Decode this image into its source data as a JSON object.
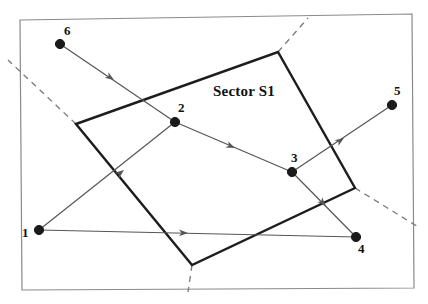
{
  "figure": {
    "width": 428,
    "height": 304,
    "background": "#ffffff",
    "frame": {
      "name": "outer-border",
      "points": "20,20 412,14 414,288 22,290",
      "color": "#8a8a8a",
      "width": 1.2
    },
    "sector": {
      "label": "Sector S1",
      "label_x": 213,
      "label_y": 83,
      "boundary_points": "76,124 278,52 355,188 192,265",
      "color": "#1d1d1d",
      "width": 2.4
    },
    "dashed": {
      "color": "#7a7a7a",
      "width": 1.3,
      "dash": "6,5",
      "segments": [
        {
          "name": "dashed-left",
          "x1": 76,
          "y1": 124,
          "x2": 8,
          "y2": 60
        },
        {
          "name": "dashed-top",
          "x1": 278,
          "y1": 52,
          "x2": 308,
          "y2": 18
        },
        {
          "name": "dashed-right",
          "x1": 355,
          "y1": 188,
          "x2": 420,
          "y2": 228
        },
        {
          "name": "dashed-bottom",
          "x1": 192,
          "y1": 265,
          "x2": 188,
          "y2": 292
        }
      ]
    },
    "edge_style": {
      "color": "#555555",
      "width": 1.2,
      "arrow_color": "#555555"
    },
    "nodes": [
      {
        "id": "1",
        "label": "1",
        "x": 39,
        "y": 230,
        "label_x": 22,
        "label_y": 226,
        "r": 4.6
      },
      {
        "id": "2",
        "label": "2",
        "x": 175,
        "y": 122,
        "label_x": 178,
        "label_y": 101,
        "r": 4.6
      },
      {
        "id": "3",
        "label": "3",
        "x": 292,
        "y": 172,
        "label_x": 291,
        "label_y": 151,
        "r": 4.6
      },
      {
        "id": "4",
        "label": "4",
        "x": 356,
        "y": 237,
        "label_x": 358,
        "label_y": 242,
        "r": 4.6
      },
      {
        "id": "5",
        "label": "5",
        "x": 392,
        "y": 105,
        "label_x": 394,
        "label_y": 84,
        "r": 4.6
      },
      {
        "id": "6",
        "label": "6",
        "x": 60,
        "y": 44,
        "label_x": 64,
        "label_y": 24,
        "r": 4.6
      }
    ],
    "edges": [
      {
        "name": "edge-6-to-2",
        "from": "6",
        "to": "2",
        "x1": 60,
        "y1": 44,
        "x2": 175,
        "y2": 122,
        "arrow_x": 114,
        "arrow_y": 80,
        "arrow_angle": 34
      },
      {
        "name": "edge-2-to-3",
        "from": "2",
        "to": "3",
        "x1": 175,
        "y1": 122,
        "x2": 292,
        "y2": 172,
        "arrow_x": 235,
        "arrow_y": 148,
        "arrow_angle": 23
      },
      {
        "name": "edge-1-to-2",
        "from": "1",
        "to": "2",
        "x1": 39,
        "y1": 230,
        "x2": 175,
        "y2": 122,
        "arrow_x": 124,
        "arrow_y": 170,
        "arrow_angle": -38
      },
      {
        "name": "edge-1-to-4",
        "from": "1",
        "to": "4",
        "x1": 39,
        "y1": 230,
        "x2": 356,
        "y2": 237,
        "arrow_x": 188,
        "arrow_y": 233,
        "arrow_angle": 1
      },
      {
        "name": "edge-3-to-5",
        "from": "3",
        "to": "5",
        "x1": 292,
        "y1": 172,
        "x2": 392,
        "y2": 105,
        "arrow_x": 344,
        "arrow_y": 138,
        "arrow_angle": -34
      },
      {
        "name": "edge-3-to-4",
        "from": "3",
        "to": "4",
        "x1": 292,
        "y1": 172,
        "x2": 356,
        "y2": 237,
        "arrow_x": 326,
        "arrow_y": 206,
        "arrow_angle": 45
      }
    ]
  }
}
